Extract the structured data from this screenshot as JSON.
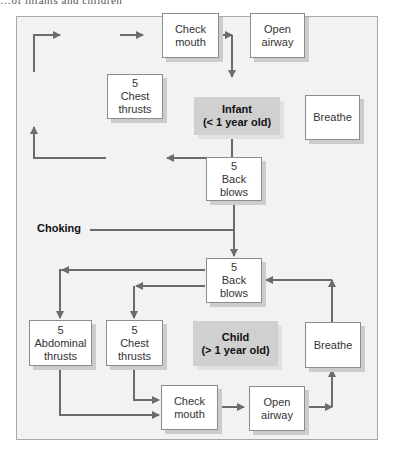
{
  "header": {
    "partial_text": "…of infants and children"
  },
  "diagram": {
    "start_label": "Choking",
    "infant": {
      "title_line1": "Infant",
      "title_line2": "(< 1 year old)",
      "nodes": {
        "back_blows": [
          "5",
          "Back",
          "blows"
        ],
        "chest_thrusts": [
          "5",
          "Chest",
          "thrusts"
        ],
        "check_mouth": [
          "Check",
          "mouth"
        ],
        "open_airway": [
          "Open",
          "airway"
        ],
        "breathe": [
          "Breathe"
        ]
      }
    },
    "child": {
      "title_line1": "Child",
      "title_line2": "(> 1 year old)",
      "nodes": {
        "back_blows": [
          "5",
          "Back",
          "blows"
        ],
        "abdominal_thrusts": [
          "5",
          "Abdominal",
          "thrusts"
        ],
        "chest_thrusts": [
          "5",
          "Chest",
          "thrusts"
        ],
        "check_mouth": [
          "Check",
          "mouth"
        ],
        "open_airway": [
          "Open",
          "airway"
        ],
        "breathe": [
          "Breathe"
        ]
      }
    },
    "colors": {
      "arrow": "#6b6b6b",
      "frame_bg": "#f2f2f2",
      "label_bg": "#d0d0d0",
      "node_bg": "#ffffff"
    }
  }
}
